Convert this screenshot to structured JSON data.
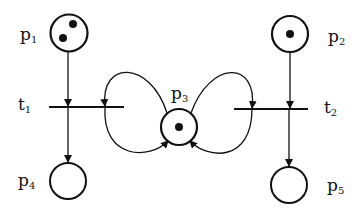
{
  "diagram": {
    "type": "petri-net",
    "stroke_color": "#111111",
    "background": "#ffffff",
    "places": [
      {
        "id": "p1",
        "label": "p",
        "sub": "1",
        "tokens": 2
      },
      {
        "id": "p2",
        "label": "p",
        "sub": "2",
        "tokens": 1
      },
      {
        "id": "p3",
        "label": "p",
        "sub": "3",
        "tokens": 1
      },
      {
        "id": "p4",
        "label": "p",
        "sub": "4",
        "tokens": 0
      },
      {
        "id": "p5",
        "label": "p",
        "sub": "5",
        "tokens": 0
      }
    ],
    "transitions": [
      {
        "id": "t1",
        "label": "t",
        "sub": "1"
      },
      {
        "id": "t2",
        "label": "t",
        "sub": "2"
      }
    ],
    "arcs": [
      {
        "from": "p1",
        "to": "t1"
      },
      {
        "from": "p3",
        "to": "t1"
      },
      {
        "from": "t1",
        "to": "p3"
      },
      {
        "from": "t1",
        "to": "p4"
      },
      {
        "from": "p2",
        "to": "t2"
      },
      {
        "from": "p3",
        "to": "t2"
      },
      {
        "from": "t2",
        "to": "p3"
      },
      {
        "from": "t2",
        "to": "p5"
      }
    ]
  }
}
